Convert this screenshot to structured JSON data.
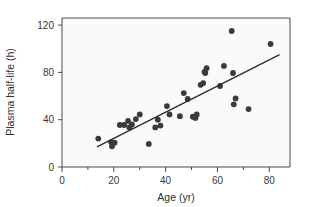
{
  "chart_data": {
    "type": "scatter",
    "title": "",
    "xlabel": "Age (yr)",
    "ylabel": "Plasma half-life (h)",
    "xlim": [
      0,
      88
    ],
    "ylim": [
      0,
      126
    ],
    "xticks": [
      0,
      20,
      40,
      60,
      80
    ],
    "xtick_labels": [
      "0",
      "20",
      "40",
      "60",
      "80"
    ],
    "xminor_ticks": [
      10,
      30,
      50,
      70
    ],
    "yticks": [
      0,
      40,
      80,
      120
    ],
    "ytick_labels": [
      "0",
      "40",
      "80",
      "120"
    ],
    "grid": false,
    "legend": false,
    "marker_color": "#3b3b3b",
    "line_color": "#2b2b2b",
    "plot_background": "#fafafa",
    "frame_color": "#4a4a4a",
    "points": [
      {
        "x": 14.0,
        "y": 24.0
      },
      {
        "x": 19.0,
        "y": 21.0
      },
      {
        "x": 19.3,
        "y": 17.5
      },
      {
        "x": 20.3,
        "y": 20.5
      },
      {
        "x": 22.3,
        "y": 35.5
      },
      {
        "x": 24.0,
        "y": 35.5
      },
      {
        "x": 25.5,
        "y": 39.0
      },
      {
        "x": 26.0,
        "y": 33.5
      },
      {
        "x": 27.0,
        "y": 36.0
      },
      {
        "x": 28.5,
        "y": 40.5
      },
      {
        "x": 30.0,
        "y": 44.5
      },
      {
        "x": 33.5,
        "y": 19.5
      },
      {
        "x": 36.0,
        "y": 33.5
      },
      {
        "x": 37.0,
        "y": 40.0
      },
      {
        "x": 38.0,
        "y": 35.0
      },
      {
        "x": 40.5,
        "y": 51.5
      },
      {
        "x": 41.5,
        "y": 44.5
      },
      {
        "x": 45.5,
        "y": 43.0
      },
      {
        "x": 47.0,
        "y": 62.5
      },
      {
        "x": 48.5,
        "y": 57.5
      },
      {
        "x": 50.5,
        "y": 42.5
      },
      {
        "x": 51.5,
        "y": 41.5
      },
      {
        "x": 52.0,
        "y": 44.5
      },
      {
        "x": 53.5,
        "y": 69.5
      },
      {
        "x": 54.5,
        "y": 71.0
      },
      {
        "x": 55.0,
        "y": 80.5
      },
      {
        "x": 55.3,
        "y": 79.5
      },
      {
        "x": 55.8,
        "y": 83.5
      },
      {
        "x": 61.0,
        "y": 68.5
      },
      {
        "x": 62.5,
        "y": 85.5
      },
      {
        "x": 65.5,
        "y": 115.0
      },
      {
        "x": 66.0,
        "y": 79.5
      },
      {
        "x": 66.3,
        "y": 53.0
      },
      {
        "x": 67.0,
        "y": 58.0
      },
      {
        "x": 72.0,
        "y": 49.0
      },
      {
        "x": 80.5,
        "y": 104.0
      }
    ],
    "trend_line": {
      "x1": 13.5,
      "y1": 17.0,
      "x2": 84.0,
      "y2": 95.0
    }
  }
}
